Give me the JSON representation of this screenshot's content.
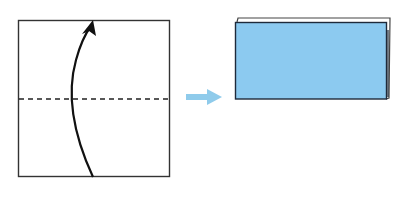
{
  "diagram": {
    "type": "origami-fold-instruction",
    "steps": [
      {
        "id": "step-before",
        "description": "Square paper with horizontal valley fold line through the middle; curved arrow indicates folding bottom half up over top half",
        "paper": {
          "x": 18,
          "y": 20,
          "width": 152,
          "height": 157,
          "fill": "#ffffff",
          "stroke": "#333333"
        },
        "fold_line": {
          "style": "dashed",
          "y": 99,
          "x1": 18,
          "x2": 170,
          "stroke": "#222222"
        },
        "fold_arrow": {
          "direction": "up",
          "start": [
            93,
            177
          ],
          "control": [
            60,
            100
          ],
          "end": [
            92,
            22
          ],
          "stroke": "#111111"
        }
      },
      {
        "id": "step-after",
        "description": "Resulting folded rectangle (half size), blue colored side showing",
        "back_layer": {
          "x": 237,
          "y": 18,
          "width": 153,
          "height": 80,
          "fill": "#ffffff",
          "stroke": "#333333"
        },
        "front_layer": {
          "x": 235,
          "y": 22,
          "width": 151,
          "height": 77,
          "fill": "#8ccaf0",
          "stroke": "#1e2a3a"
        }
      }
    ],
    "transition_arrow": {
      "x1": 186,
      "x2": 222,
      "y": 97,
      "color": "#8fcbeb"
    }
  },
  "colors": {
    "paper_front": "#8ccaf0",
    "paper_back": "#ffffff",
    "outline": "#333333",
    "arrow_blue": "#8fcbeb",
    "background": "#ffffff"
  }
}
